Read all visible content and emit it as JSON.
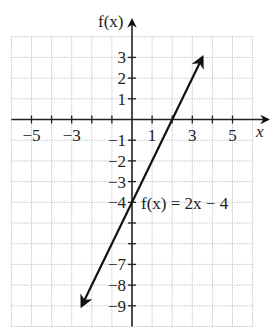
{
  "chart_data": {
    "type": "line",
    "title": "",
    "xlabel": "x",
    "ylabel": "f(x)",
    "xlim": [
      -6,
      6
    ],
    "ylim": [
      -10,
      4
    ],
    "grid": true,
    "x_tick_labels": [
      {
        "value": -5,
        "label": "−5"
      },
      {
        "value": -3,
        "label": "−3"
      },
      {
        "value": 1,
        "label": "1"
      },
      {
        "value": 3,
        "label": "3"
      },
      {
        "value": 5,
        "label": "5"
      }
    ],
    "y_tick_labels": [
      {
        "value": 3,
        "label": "3"
      },
      {
        "value": 2,
        "label": "2"
      },
      {
        "value": 1,
        "label": "1"
      },
      {
        "value": -1,
        "label": "−1"
      },
      {
        "value": -2,
        "label": "−2"
      },
      {
        "value": -3,
        "label": "−3"
      },
      {
        "value": -4,
        "label": "−4"
      },
      {
        "value": -7,
        "label": "−7"
      },
      {
        "value": -8,
        "label": "−8"
      },
      {
        "value": -9,
        "label": "−9"
      }
    ],
    "series": [
      {
        "name": "f(x) = 2x − 4",
        "equation": "f(x) = 2x - 4",
        "slope": 2,
        "intercept": -4,
        "x": [
          -2.5,
          3.5
        ],
        "y": [
          -9,
          3
        ],
        "arrows": "both"
      }
    ],
    "annotations": [
      {
        "text": "f(x) = 2x − 4",
        "x": 0.5,
        "y": -4
      }
    ],
    "colors": {
      "line": "#111111",
      "grid": "#c8c8c8",
      "axis": "#222222"
    }
  }
}
